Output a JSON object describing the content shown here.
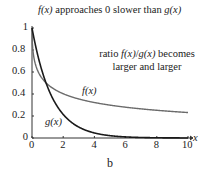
{
  "chart_data": {
    "type": "line",
    "title": "f(x) approaches 0 slower than g(x)",
    "annotation": [
      "ratio f(x)/g(x) becomes",
      "larger and larger"
    ],
    "panel_label": "b",
    "xlabel": "x",
    "ylabel": "",
    "xlim": [
      0,
      10
    ],
    "ylim": [
      0,
      1
    ],
    "x_ticks": [
      0,
      2,
      4,
      6,
      8,
      10
    ],
    "y_ticks": [
      0,
      0.2,
      0.4,
      0.6,
      0.8,
      1
    ],
    "y_tick_labels": [
      "0",
      "0.2",
      "0.4",
      "0.6",
      "0.8",
      "1"
    ],
    "grid": false,
    "series": [
      {
        "name": "f(x)",
        "color": "#6b6b6b",
        "x": [
          0,
          0.5,
          1,
          2,
          3,
          4,
          5,
          6,
          7,
          8,
          9,
          10
        ],
        "values": [
          1.0,
          0.57,
          0.49,
          0.4,
          0.35,
          0.32,
          0.3,
          0.28,
          0.27,
          0.26,
          0.25,
          0.24
        ]
      },
      {
        "name": "g(x)",
        "color": "#1a1a1a",
        "x": [
          0,
          0.5,
          1,
          2,
          3,
          4,
          5,
          6,
          7,
          8,
          9,
          10
        ],
        "values": [
          1.0,
          0.68,
          0.46,
          0.21,
          0.1,
          0.05,
          0.02,
          0.01,
          0.005,
          0.002,
          0.001,
          0.0005
        ]
      }
    ],
    "series_labels": {
      "f": "f(x)",
      "g": "g(x)"
    }
  }
}
